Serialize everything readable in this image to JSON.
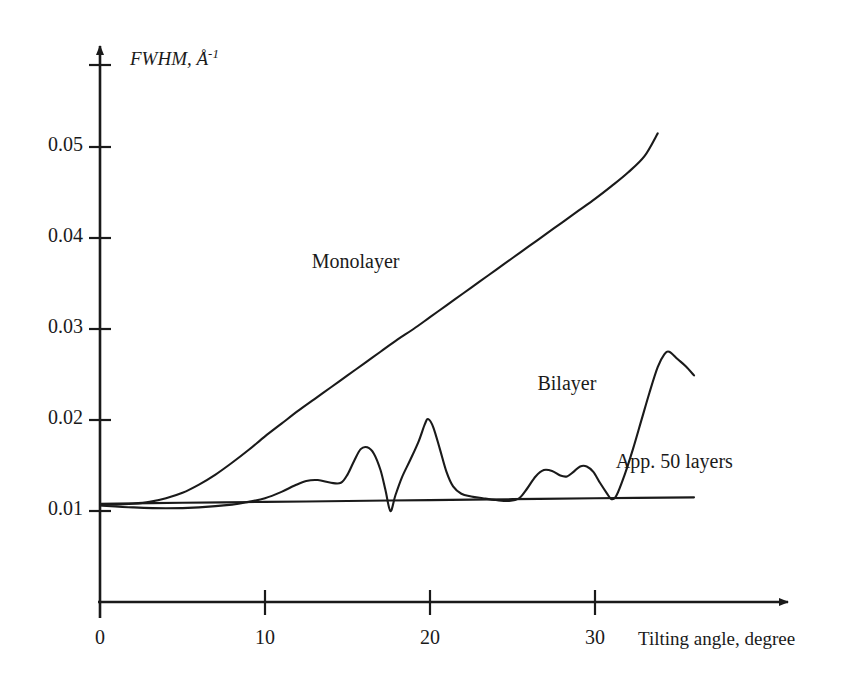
{
  "chart_data": {
    "type": "line",
    "title": "",
    "xlabel": "Tilting angle, degree",
    "ylabel": "FWHM, Å⁻¹",
    "ylabel_main": "FWHM, Å",
    "ylabel_exponent": "-1",
    "xlim": [
      0,
      36
    ],
    "ylim": [
      0.0,
      0.0585
    ],
    "xticks": [
      0,
      10,
      20,
      30
    ],
    "xtick_labels": [
      "0",
      "10",
      "20",
      "30"
    ],
    "yticks": [
      0.01,
      0.02,
      0.03,
      0.04,
      0.05
    ],
    "ytick_labels": [
      "0.01",
      "0.02",
      "0.03",
      "0.04",
      "0.05"
    ],
    "grid": false,
    "legend_position": "inline-annotations",
    "series": [
      {
        "name": "Monolayer",
        "label_x": 15.5,
        "label_y": 0.0372,
        "points": [
          [
            0.0,
            0.0107
          ],
          [
            1.0,
            0.0107
          ],
          [
            2.0,
            0.0108
          ],
          [
            3.0,
            0.011
          ],
          [
            4.0,
            0.0114
          ],
          [
            5.0,
            0.012
          ],
          [
            6.0,
            0.0129
          ],
          [
            7.0,
            0.014
          ],
          [
            8.0,
            0.0153
          ],
          [
            9.0,
            0.0167
          ],
          [
            10.0,
            0.0182
          ],
          [
            11.0,
            0.0196
          ],
          [
            12.0,
            0.021
          ],
          [
            13.0,
            0.0223
          ],
          [
            14.0,
            0.0236
          ],
          [
            15.0,
            0.0249
          ],
          [
            16.0,
            0.0262
          ],
          [
            17.0,
            0.0275
          ],
          [
            18.0,
            0.0288
          ],
          [
            19.0,
            0.03
          ],
          [
            20.0,
            0.0313
          ],
          [
            21.0,
            0.0326
          ],
          [
            22.0,
            0.0339
          ],
          [
            23.0,
            0.0352
          ],
          [
            24.0,
            0.0365
          ],
          [
            25.0,
            0.0378
          ],
          [
            26.0,
            0.0391
          ],
          [
            27.0,
            0.0404
          ],
          [
            28.0,
            0.0417
          ],
          [
            29.0,
            0.043
          ],
          [
            30.0,
            0.0443
          ],
          [
            31.0,
            0.0457
          ],
          [
            32.0,
            0.0472
          ],
          [
            33.0,
            0.049
          ],
          [
            33.8,
            0.0515
          ]
        ]
      },
      {
        "name": "Bilayer",
        "label_x": 28.3,
        "label_y": 0.0238,
        "points": [
          [
            0.0,
            0.0106
          ],
          [
            2.0,
            0.0104
          ],
          [
            4.0,
            0.0103
          ],
          [
            6.0,
            0.0104
          ],
          [
            8.0,
            0.0107
          ],
          [
            9.0,
            0.011
          ],
          [
            10.0,
            0.0114
          ],
          [
            11.0,
            0.0121
          ],
          [
            11.8,
            0.0128
          ],
          [
            12.5,
            0.0133
          ],
          [
            13.2,
            0.0134
          ],
          [
            14.0,
            0.0131
          ],
          [
            14.6,
            0.0131
          ],
          [
            15.0,
            0.014
          ],
          [
            15.4,
            0.0155
          ],
          [
            15.8,
            0.0168
          ],
          [
            16.2,
            0.017
          ],
          [
            16.6,
            0.0163
          ],
          [
            17.0,
            0.0145
          ],
          [
            17.3,
            0.0123
          ],
          [
            17.6,
            0.01
          ],
          [
            17.9,
            0.0117
          ],
          [
            18.3,
            0.0137
          ],
          [
            18.8,
            0.0156
          ],
          [
            19.3,
            0.0176
          ],
          [
            19.7,
            0.0196
          ],
          [
            19.9,
            0.0201
          ],
          [
            20.2,
            0.0192
          ],
          [
            20.6,
            0.0168
          ],
          [
            21.0,
            0.0143
          ],
          [
            21.4,
            0.0127
          ],
          [
            21.9,
            0.0119
          ],
          [
            22.5,
            0.0116
          ],
          [
            23.2,
            0.0114
          ],
          [
            24.0,
            0.0112
          ],
          [
            24.8,
            0.0111
          ],
          [
            25.4,
            0.0114
          ],
          [
            25.9,
            0.0125
          ],
          [
            26.4,
            0.0138
          ],
          [
            26.9,
            0.0145
          ],
          [
            27.4,
            0.0144
          ],
          [
            27.9,
            0.0139
          ],
          [
            28.3,
            0.0138
          ],
          [
            28.7,
            0.0143
          ],
          [
            29.1,
            0.0149
          ],
          [
            29.5,
            0.0149
          ],
          [
            29.9,
            0.0143
          ],
          [
            30.3,
            0.0131
          ],
          [
            30.7,
            0.012
          ],
          [
            31.0,
            0.0113
          ],
          [
            31.3,
            0.0117
          ],
          [
            31.8,
            0.014
          ],
          [
            32.3,
            0.0168
          ],
          [
            32.8,
            0.0199
          ],
          [
            33.3,
            0.023
          ],
          [
            33.8,
            0.0258
          ],
          [
            34.2,
            0.0272
          ],
          [
            34.5,
            0.0275
          ],
          [
            35.0,
            0.0267
          ],
          [
            35.5,
            0.0259
          ],
          [
            36.0,
            0.0249
          ]
        ]
      },
      {
        "name": "App. 50 layers",
        "label_x": 34.8,
        "label_y": 0.0153,
        "points": [
          [
            0.0,
            0.0108
          ],
          [
            5.0,
            0.0109
          ],
          [
            10.0,
            0.011
          ],
          [
            15.0,
            0.0111
          ],
          [
            20.0,
            0.0112
          ],
          [
            25.0,
            0.0113
          ],
          [
            30.0,
            0.0114
          ],
          [
            36.0,
            0.0115
          ]
        ]
      }
    ]
  },
  "annotations": {
    "monolayer": "Monolayer",
    "bilayer": "Bilayer",
    "app50": "App. 50 layers"
  },
  "colors": {
    "ink": "#1a1a1a",
    "background": "#ffffff"
  }
}
